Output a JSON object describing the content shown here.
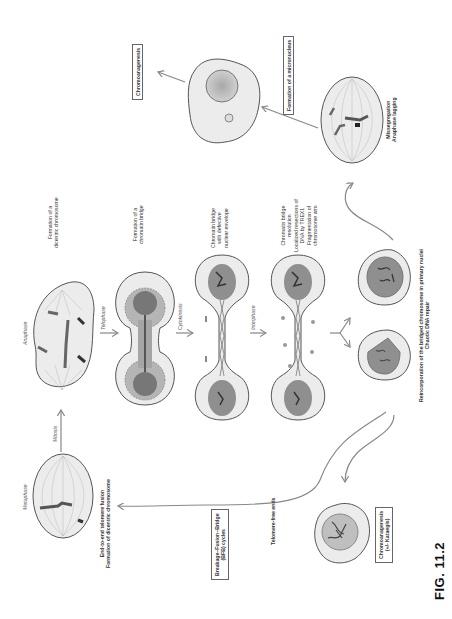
{
  "figure": {
    "caption": "FIG. 11.2",
    "orientation": "rotated 90° counter-clockwise"
  },
  "stages": {
    "metaphase": "Metaphase",
    "mitosis": "Mitosis",
    "anaphase": "Anaphase",
    "telophase": "Telophase",
    "cytokinesis": "Cytokinesis",
    "interphase": "Interphase"
  },
  "labels": {
    "end_to_end_line1": "End-to-end telomere fusion",
    "end_to_end_line2": "Formation of dicentric chromosome",
    "dicentric_line1": "Formation of a",
    "dicentric_line2": "dicentric chromosome",
    "bridge_line1": "Formation of a",
    "bridge_line2": "chromatin bridge",
    "defective_line1": "Chromatin bridge",
    "defective_line2": "with defective",
    "defective_line3": "nuclear envelope",
    "resolution_line1": "Chromatin bridge",
    "resolution_line2": "resolution",
    "resolution_line3": "Localized resections of",
    "resolution_line4": "DNA by TREX1",
    "resolution_line5": "Fragmentation of",
    "resolution_line6": "chromosome arm",
    "reincorp_line1": "Reincorporation of the bridged chromosome in primary nuclei",
    "reincorp_line2": "Chaotic DNA repair",
    "missegregation_line1": "Missegregation",
    "missegregation_line2": "Anaphase lagging",
    "telomere_free": "Telomere-free ends"
  },
  "boxes": {
    "chromoanagenesis_top": "Chromoanagenesis",
    "micronucleus": "Formation of a micronucleus",
    "bfb_line1": "Breakage–Fusion–Bridge",
    "bfb_line2": "(BFB) cycles",
    "chromo_bottom_line1": "Chromoanagenesis",
    "chromo_bottom_line2": "(+/- Kataegis)"
  },
  "colors": {
    "cell_fill": "#ececec",
    "cell_stroke": "#555555",
    "nucleus_light": "#b9b9b9",
    "nucleus_dark": "#8c8c8c",
    "chromatin": "#444444",
    "arrow": "#888888"
  }
}
